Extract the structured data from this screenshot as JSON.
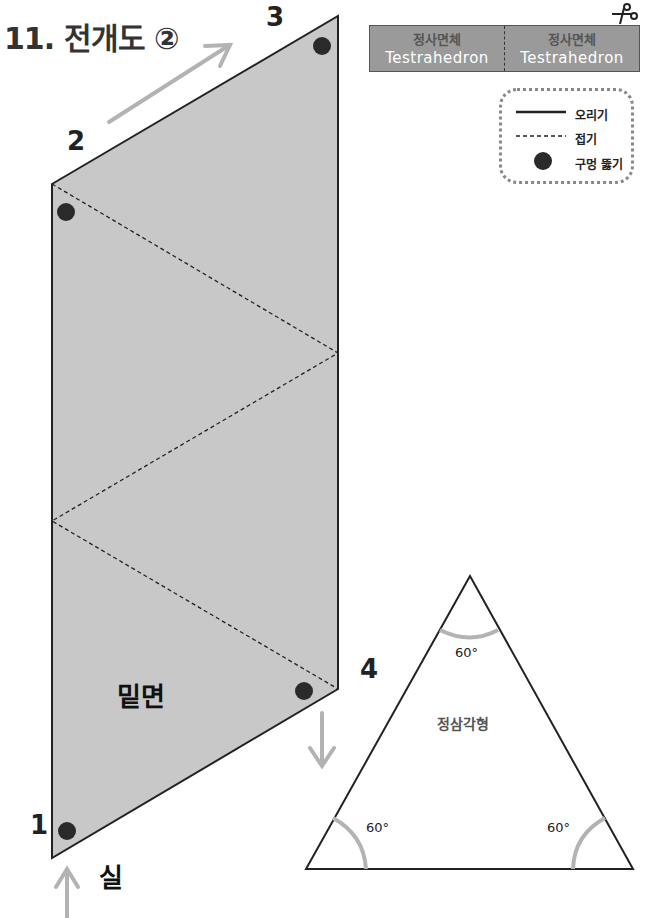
{
  "title": "11. 전개도 ②",
  "label_box": {
    "cells": [
      {
        "korean": "정사면체",
        "english": "Testrahedron"
      },
      {
        "korean": "정사면체",
        "english": "Testrahedron"
      }
    ],
    "icon": "scissors-icon"
  },
  "legend": {
    "items": [
      {
        "symbol": "solid-line",
        "label": "오리기"
      },
      {
        "symbol": "dashed-line",
        "label": "접기"
      },
      {
        "symbol": "filled-dot",
        "label": "구멍 뚫기"
      }
    ]
  },
  "net": {
    "fill_color": "#c8c8c8",
    "vertex_labels": [
      "1",
      "2",
      "3",
      "4"
    ],
    "base_label": "밑면",
    "thread_label": "실"
  },
  "triangle": {
    "label": "정삼각형",
    "angles": [
      "60°",
      "60°",
      "60°"
    ]
  },
  "colors": {
    "arrow": "#b3b3b3",
    "dot": "#2a2a2a",
    "label_box_bg": "#9a9a9a",
    "angle_arc": "#b3b3b3"
  }
}
